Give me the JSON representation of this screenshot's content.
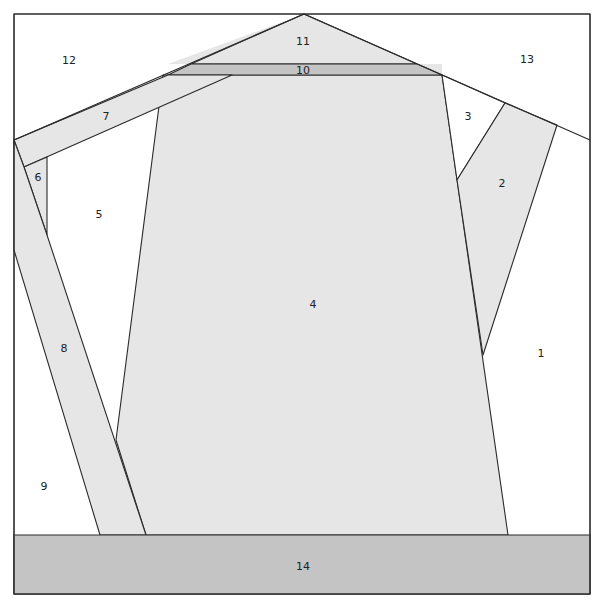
{
  "diagram": {
    "type": "paper-piecing pattern",
    "colors": {
      "background": "#ffffff",
      "light_fabric": "#e6e6e6",
      "dark_fabric": "#c4c4c4",
      "outline": "#2a2a2a"
    },
    "pieces": [
      {
        "id": "1",
        "label": "1",
        "x": 541,
        "y": 353,
        "fill": "white"
      },
      {
        "id": "2",
        "label": "2",
        "x": 502,
        "y": 183,
        "fill": "light"
      },
      {
        "id": "3",
        "label": "3",
        "x": 468,
        "y": 116,
        "fill": "white"
      },
      {
        "id": "4",
        "label": "4",
        "x": 313,
        "y": 304,
        "fill": "light"
      },
      {
        "id": "5",
        "label": "5",
        "x": 99,
        "y": 214,
        "fill": "white"
      },
      {
        "id": "6",
        "label": "6",
        "x": 38,
        "y": 177,
        "fill": "light"
      },
      {
        "id": "7",
        "label": "7",
        "x": 106,
        "y": 116,
        "fill": "light"
      },
      {
        "id": "8",
        "label": "8",
        "x": 64,
        "y": 348,
        "fill": "light"
      },
      {
        "id": "9",
        "label": "9",
        "x": 44,
        "y": 486,
        "fill": "white"
      },
      {
        "id": "10",
        "label": "10",
        "x": 303,
        "y": 70,
        "fill": "dark"
      },
      {
        "id": "11",
        "label": "11",
        "x": 303,
        "y": 41,
        "fill": "light"
      },
      {
        "id": "12",
        "label": "12",
        "x": 69,
        "y": 60,
        "fill": "white"
      },
      {
        "id": "13",
        "label": "13",
        "x": 527,
        "y": 59,
        "fill": "white"
      },
      {
        "id": "14",
        "label": "14",
        "x": 303,
        "y": 566,
        "fill": "dark"
      }
    ]
  }
}
